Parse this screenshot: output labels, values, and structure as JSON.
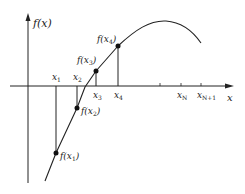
{
  "diagram": {
    "title": "",
    "axes": {
      "y_label": "f(x)",
      "x_label": "x"
    },
    "x_ticks": [
      {
        "name": "x",
        "sub": "1"
      },
      {
        "name": "x",
        "sub": "2"
      },
      {
        "name": "x",
        "sub": "3"
      },
      {
        "name": "x",
        "sub": "4"
      },
      {
        "name": "x",
        "sub": "N"
      },
      {
        "name": "x",
        "sub": "N+1"
      }
    ],
    "points": [
      {
        "label": "f(x",
        "sub": "1",
        "close": ")"
      },
      {
        "label": "f(x",
        "sub": "2",
        "close": ")"
      },
      {
        "label": "f(x",
        "sub": "3",
        "close": ")"
      },
      {
        "label": "f(x",
        "sub": "4",
        "close": ")"
      }
    ],
    "colors": {
      "line": "#222222",
      "background": "#ffffff"
    }
  }
}
